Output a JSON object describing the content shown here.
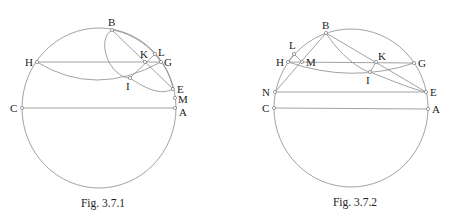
{
  "figures": [
    {
      "id": "fig1",
      "caption": "Fig. 3.7.1",
      "caption_pos": [
        103,
        207
      ],
      "circle": {
        "cx": 99,
        "cy": 108,
        "rx": 77,
        "ry": 80
      },
      "points": {
        "B": {
          "x": 112,
          "y": 30,
          "lx": 108,
          "ly": 26,
          "label": "B"
        },
        "H": {
          "x": 37,
          "y": 62,
          "lx": 25,
          "ly": 66,
          "label": "H"
        },
        "K": {
          "x": 145,
          "y": 62,
          "lx": 140,
          "ly": 58,
          "label": "K"
        },
        "L": {
          "x": 155,
          "y": 54,
          "lx": 158,
          "ly": 56,
          "label": "L"
        },
        "G": {
          "x": 161,
          "y": 62,
          "lx": 164,
          "ly": 66,
          "label": "G"
        },
        "I": {
          "x": 130,
          "y": 78,
          "lx": 126,
          "ly": 90,
          "label": "I"
        },
        "E": {
          "x": 173,
          "y": 89,
          "lx": 177,
          "ly": 93,
          "label": "E"
        },
        "M": {
          "x": 175,
          "y": 98,
          "lx": 178,
          "ly": 103,
          "label": "M"
        },
        "A": {
          "x": 175,
          "y": 108,
          "lx": 179,
          "ly": 116,
          "label": "A"
        },
        "C": {
          "x": 22,
          "y": 108,
          "lx": 10,
          "ly": 112,
          "label": "C"
        }
      },
      "lines": [
        [
          "H",
          "G"
        ],
        [
          "C",
          "A"
        ],
        [
          "B",
          "E"
        ],
        [
          "I",
          "L"
        ],
        [
          "L",
          "G"
        ]
      ],
      "curves": [
        "M 37 62 Q 95 98 161 62",
        "M 112 30 C 95 40 110 78 130 78 C 145 88 160 96 173 89",
        "M 112 30 C 140 34 168 60 173 89"
      ]
    },
    {
      "id": "fig2",
      "caption": "Fig. 3.7.2",
      "caption_pos": [
        355,
        206
      ],
      "circle": {
        "cx": 351,
        "cy": 108,
        "rx": 77,
        "ry": 79
      },
      "points": {
        "B": {
          "x": 326,
          "y": 33,
          "lx": 322,
          "ly": 29,
          "label": "B"
        },
        "L": {
          "x": 294,
          "y": 54,
          "lx": 289,
          "ly": 49,
          "label": "L"
        },
        "H": {
          "x": 288,
          "y": 62,
          "lx": 276,
          "ly": 66,
          "label": "H"
        },
        "M": {
          "x": 302,
          "y": 62,
          "lx": 306,
          "ly": 66,
          "label": "M"
        },
        "K": {
          "x": 376,
          "y": 62,
          "lx": 378,
          "ly": 60,
          "label": "K"
        },
        "G": {
          "x": 414,
          "y": 63,
          "lx": 418,
          "ly": 67,
          "label": "G"
        },
        "I": {
          "x": 370,
          "y": 72,
          "lx": 366,
          "ly": 84,
          "label": "I"
        },
        "N": {
          "x": 275,
          "y": 92,
          "lx": 262,
          "ly": 96,
          "label": "N"
        },
        "E": {
          "x": 426,
          "y": 92,
          "lx": 430,
          "ly": 96,
          "label": "E"
        },
        "C": {
          "x": 274,
          "y": 108,
          "lx": 262,
          "ly": 112,
          "label": "C"
        },
        "A": {
          "x": 428,
          "y": 109,
          "lx": 432,
          "ly": 113,
          "label": "A"
        }
      },
      "lines": [
        [
          "H",
          "G"
        ],
        [
          "N",
          "E"
        ],
        [
          "C",
          "A"
        ],
        [
          "B",
          "E"
        ],
        [
          "B",
          "N"
        ],
        [
          "H",
          "L"
        ],
        [
          "L",
          "M"
        ],
        [
          "K",
          "I"
        ]
      ],
      "curves": [
        "M 288 62 Q 352 84 414 63",
        "M 326 33 C 340 55 360 70 370 72 C 395 82 415 90 426 92"
      ]
    }
  ]
}
